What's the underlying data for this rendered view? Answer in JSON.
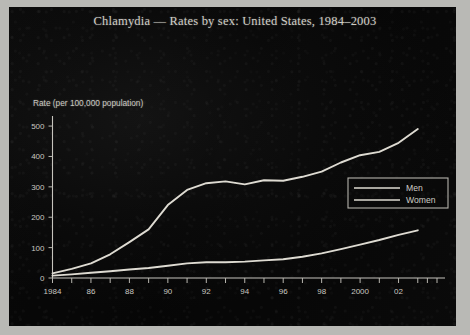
{
  "chart_data": {
    "type": "line",
    "title": "Chlamydia — Rates by sex: United States, 1984–2003",
    "xlabel": "",
    "ylabel": "Rate (per 100,000 population)",
    "ylim": [
      0,
      520
    ],
    "xlim": [
      1984,
      2003
    ],
    "yticks": [
      0,
      100,
      200,
      300,
      400,
      500
    ],
    "ytick_labels": [
      "0",
      "100",
      "200",
      "300",
      "400",
      "500"
    ],
    "x": [
      1984,
      1985,
      1986,
      1987,
      1988,
      1989,
      1990,
      1991,
      1992,
      1993,
      1994,
      1995,
      1996,
      1997,
      1998,
      1999,
      2000,
      2001,
      2002,
      2003
    ],
    "xtick_labels": [
      "1984",
      "",
      "86",
      "",
      "88",
      "",
      "90",
      "",
      "92",
      "",
      "94",
      "",
      "96",
      "",
      "98",
      "",
      "2000",
      "",
      "02",
      ""
    ],
    "grid": false,
    "legend_position": "right-middle",
    "series": [
      {
        "name": "Men",
        "values": [
          8,
          12,
          17,
          22,
          28,
          33,
          40,
          48,
          52,
          52,
          54,
          58,
          62,
          70,
          81,
          95,
          110,
          125,
          142,
          157
        ]
      },
      {
        "name": "Women",
        "values": [
          15,
          30,
          48,
          78,
          118,
          160,
          240,
          290,
          312,
          318,
          308,
          322,
          320,
          333,
          350,
          380,
          404,
          415,
          445,
          490
        ]
      }
    ]
  },
  "legend": {
    "entries": [
      {
        "label": "Men"
      },
      {
        "label": "Women"
      }
    ]
  }
}
